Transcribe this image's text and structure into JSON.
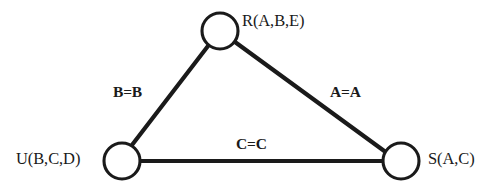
{
  "diagram": {
    "kind": "join-graph",
    "background_color": "#ffffff",
    "stroke_color": "#1a1a1a",
    "node_fill_color": "#ffffff",
    "nodes": [
      {
        "id": "R",
        "label": "R(A,B,E)",
        "cx": 220,
        "cy": 31,
        "r": 18,
        "label_side": "right"
      },
      {
        "id": "U",
        "label": "U(B,C,D)",
        "cx": 122,
        "cy": 161,
        "r": 18,
        "label_side": "left"
      },
      {
        "id": "S",
        "label": "S(A,C)",
        "cx": 401,
        "cy": 161,
        "r": 18,
        "label_side": "right"
      }
    ],
    "edges": [
      {
        "id": "edge-U-R",
        "from": "U",
        "to": "R",
        "label": "B=B"
      },
      {
        "id": "edge-R-S",
        "from": "R",
        "to": "S",
        "label": "A=A"
      },
      {
        "id": "edge-U-S",
        "from": "U",
        "to": "S",
        "label": "C=C"
      }
    ]
  }
}
